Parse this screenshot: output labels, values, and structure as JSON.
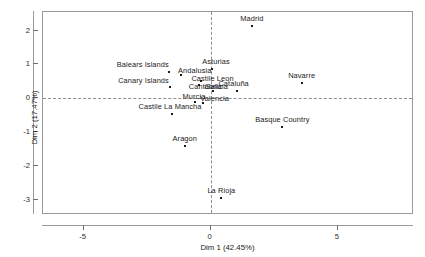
{
  "chart_data": {
    "type": "scatter",
    "title": "",
    "xlabel": "Dim 1 (42.45%)",
    "ylabel": "Dim 2 (17.47%)",
    "xlim": [
      -6.6,
      8.0
    ],
    "ylim": [
      -3.45,
      2.55
    ],
    "xticks": [
      -5,
      0,
      5
    ],
    "xticklabels": [
      "-5",
      "0",
      "5"
    ],
    "yticks": [
      2,
      1,
      0,
      -1,
      -2,
      -3
    ],
    "yticklabels": [
      "2",
      "1",
      "0",
      "-1",
      "-2",
      "-3"
    ],
    "grid": false,
    "legend": false,
    "reference_lines": {
      "vertical_x": 0,
      "horizontal_y": 0,
      "style": "dashed"
    },
    "points": [
      {
        "label": "Madrid",
        "x": 1.62,
        "y": 2.13,
        "label_dx": 0,
        "label_dy": -4
      },
      {
        "label": "Balears Islands",
        "x": -1.65,
        "y": 0.78,
        "label_dx": -26,
        "label_dy": -4
      },
      {
        "label": "Asturias",
        "x": 0.05,
        "y": 0.86,
        "label_dx": 4,
        "label_dy": -4
      },
      {
        "label": "Andalusia",
        "x": -1.18,
        "y": 0.7,
        "label_dx": 14,
        "label_dy": -1
      },
      {
        "label": "Castile Leon",
        "x": -0.4,
        "y": 0.5,
        "label_dx": 12,
        "label_dy": 1
      },
      {
        "label": "Canary Islands",
        "x": -1.62,
        "y": 0.33,
        "label_dx": -26,
        "label_dy": -3
      },
      {
        "label": "Galicia",
        "x": -0.45,
        "y": 0.4,
        "label_dx": 17,
        "label_dy": 5
      },
      {
        "label": "Cataluña",
        "x": 1.02,
        "y": 0.22,
        "label_dx": -3,
        "label_dy": -4
      },
      {
        "label": "Navarre",
        "x": 3.58,
        "y": 0.45,
        "label_dx": 0,
        "label_dy": -4
      },
      {
        "label": "Cantabria",
        "x": 0.1,
        "y": 0.22,
        "label_dx": -8,
        "label_dy": -1
      },
      {
        "label": "Murcia",
        "x": -0.62,
        "y": -0.1,
        "label_dx": -1,
        "label_dy": -2
      },
      {
        "label": "Valencia",
        "x": -0.32,
        "y": -0.14,
        "label_dx": 12,
        "label_dy": -1
      },
      {
        "label": "Castile La Mancha",
        "x": -1.52,
        "y": -0.45,
        "label_dx": -2,
        "label_dy": -4
      },
      {
        "label": "Basque Country",
        "x": 2.82,
        "y": -0.84,
        "label_dx": 0,
        "label_dy": -4
      },
      {
        "label": "Aragon",
        "x": -1.02,
        "y": -1.4,
        "label_dx": 0,
        "label_dy": -4
      },
      {
        "label": "La Rioja",
        "x": 0.42,
        "y": -2.96,
        "label_dx": 0,
        "label_dy": -4
      }
    ]
  }
}
